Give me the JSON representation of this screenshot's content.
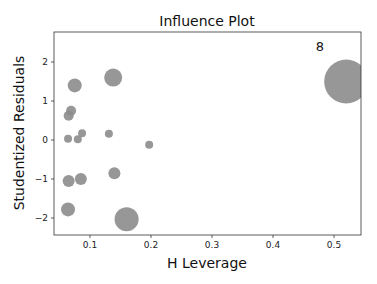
{
  "chart_data": {
    "type": "scatter",
    "title": "Influence Plot",
    "xlabel": "H Leverage",
    "ylabel": "Studentized Residuals",
    "xlim": [
      0.04,
      0.545
    ],
    "ylim": [
      -2.42,
      2.78
    ],
    "xticks": [
      "0.1",
      "0.2",
      "0.3",
      "0.4",
      "0.5"
    ],
    "yticks": [
      "2",
      "1",
      "0",
      "−1",
      "−2"
    ],
    "grid": false,
    "legend": null,
    "marker_color": "#8c8c8c",
    "annotations": [
      {
        "text": "8",
        "x": 0.48,
        "y": 2.35
      }
    ],
    "points": [
      {
        "x": 0.075,
        "y": 1.4,
        "size": 7
      },
      {
        "x": 0.138,
        "y": 1.6,
        "size": 9
      },
      {
        "x": 0.069,
        "y": 0.75,
        "size": 5
      },
      {
        "x": 0.065,
        "y": 0.62,
        "size": 5
      },
      {
        "x": 0.064,
        "y": 0.03,
        "size": 4
      },
      {
        "x": 0.08,
        "y": 0.02,
        "size": 4
      },
      {
        "x": 0.087,
        "y": 0.17,
        "size": 4
      },
      {
        "x": 0.131,
        "y": 0.16,
        "size": 4
      },
      {
        "x": 0.197,
        "y": -0.12,
        "size": 4
      },
      {
        "x": 0.065,
        "y": -1.05,
        "size": 6
      },
      {
        "x": 0.085,
        "y": -1.0,
        "size": 6
      },
      {
        "x": 0.14,
        "y": -0.85,
        "size": 6
      },
      {
        "x": 0.064,
        "y": -1.78,
        "size": 7
      },
      {
        "x": 0.16,
        "y": -2.03,
        "size": 12
      },
      {
        "x": 0.52,
        "y": 1.5,
        "size": 22,
        "label": "8"
      }
    ]
  }
}
